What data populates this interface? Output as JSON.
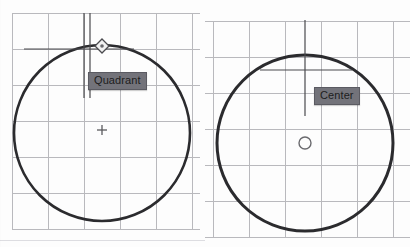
{
  "app": {
    "title": "CAD object snap illustration",
    "background_color": "#fdfdfd",
    "grid_color": "#b9b9bd",
    "grid_minor_color": "#d8d8dc",
    "geometry_color": "#2b2b2e",
    "crosshair_color": "#4a4a4e",
    "tooltip_fill": "#73737a",
    "tooltip_border": "#5b5b62",
    "tooltip_text_color": "#1d1d20"
  },
  "panels": [
    {
      "id": "left",
      "name": "quadrant-snap-panel",
      "grid": {
        "spacing_x": 36,
        "spacing_y": 36,
        "origin_x": 12,
        "origin_y": 13,
        "columns": 6,
        "rows": 6
      },
      "circle": {
        "center_x": 102,
        "center_y": 133,
        "radius": 88,
        "stroke_width": 2.6
      },
      "crosshair": {
        "vertical_lines_x": [
          84,
          90
        ],
        "vertical_top": 13,
        "vertical_bottom": 98,
        "horizontal_y": 49,
        "horizontal_left": 24,
        "horizontal_right": 134
      },
      "snap_marker": {
        "type": "quadrant-diamond",
        "x": 102,
        "y": 46,
        "size": 7
      },
      "center_marker": {
        "type": "cross",
        "x": 102,
        "y": 130,
        "size": 7
      },
      "tooltip": {
        "label": "Quadrant",
        "x": 88,
        "y": 72
      }
    },
    {
      "id": "right",
      "name": "center-snap-panel",
      "grid": {
        "spacing_x": 36,
        "spacing_y": 36,
        "origin_x": 14,
        "origin_y": 21,
        "columns": 6,
        "rows": 6
      },
      "circle": {
        "center_x": 305,
        "center_y": 143,
        "radius": 88,
        "stroke_width": 3.0
      },
      "crosshair": {
        "vertical_lines_x": [
          305
        ],
        "vertical_top": 20,
        "vertical_bottom": 116,
        "horizontal_y": 70,
        "horizontal_left": 260,
        "horizontal_right": 352
      },
      "snap_marker": {
        "type": "center-circle",
        "x": 305,
        "y": 143,
        "size": 6
      },
      "tooltip": {
        "label": "Center",
        "x": 314,
        "y": 87
      }
    }
  ],
  "tooltips": {
    "quadrant_label": "Quadrant",
    "center_label": "Center"
  }
}
